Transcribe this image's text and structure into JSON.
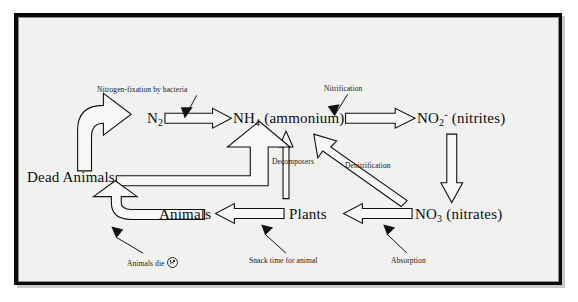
{
  "diagram": {
    "background_color": "#f1f1ef",
    "frame_color": "#0a0a0a",
    "ink_color": "#0d0d0d",
    "nodes": [
      {
        "id": "n2",
        "text": "N2",
        "display": "N₂",
        "x": 128,
        "y": 100
      },
      {
        "id": "nh4",
        "text": "NH4 (ammonium)",
        "display": "NH₄ (ammonium)",
        "x": 228,
        "y": 100
      },
      {
        "id": "no2",
        "text": "NO2- (nitrites)",
        "display": "NO₂⁻ (nitrites)",
        "x": 410,
        "y": 100
      },
      {
        "id": "no3",
        "text": "NO3 (nitrates)",
        "display": "NO₃ (nitrates)",
        "x": 408,
        "y": 196
      },
      {
        "id": "plants",
        "text": "Plants",
        "display": "Plants",
        "x": 294,
        "y": 196
      },
      {
        "id": "animals",
        "text": "Animals",
        "display": "Animals",
        "x": 160,
        "y": 196
      },
      {
        "id": "dead_animals",
        "text": "Dead Animals",
        "display": "Dead Animals",
        "x": 10,
        "y": 160
      }
    ],
    "process_labels": [
      {
        "id": "nitrogen_fixation",
        "text": "Nitrogen-fixation by bacteria",
        "x": 96,
        "y": 66
      },
      {
        "id": "nitrification",
        "text": "Nitrification",
        "x": 324,
        "y": 64
      },
      {
        "id": "decomposers",
        "text": "Decomposers",
        "x": 239,
        "y": 143
      },
      {
        "id": "denitrification",
        "text": "Denitrification",
        "x": 334,
        "y": 145
      },
      {
        "id": "animals_die",
        "text": "Animals die",
        "x": 104,
        "y": 226,
        "icon": "sad-face-icon"
      },
      {
        "id": "snack_time",
        "text": "Snack time for animal",
        "x": 210,
        "y": 226
      },
      {
        "id": "absorption",
        "text": "Absorption",
        "x": 345,
        "y": 226
      }
    ],
    "flows": [
      {
        "id": "flow-n2-to-nh4",
        "from": "N2",
        "to": "NH4 (ammonium)",
        "label": "Nitrogen-fixation by bacteria",
        "style": "block-arrow"
      },
      {
        "id": "flow-nh4-to-no2",
        "from": "NH4 (ammonium)",
        "to": "NO2- (nitrites)",
        "label": "Nitrification",
        "style": "block-arrow"
      },
      {
        "id": "flow-no2-to-no3",
        "from": "NO2- (nitrites)",
        "to": "NO3 (nitrates)",
        "label": "",
        "style": "block-arrow-down"
      },
      {
        "id": "flow-no3-to-plants",
        "from": "NO3 (nitrates)",
        "to": "Plants",
        "label": "Absorption",
        "style": "block-arrow-left"
      },
      {
        "id": "flow-no3-to-nh4",
        "from": "NO3 (nitrates)",
        "to": "NH4 (ammonium)",
        "label": "Denitrification",
        "style": "diagonal-arrow"
      },
      {
        "id": "flow-plants-to-nh4",
        "from": "Plants",
        "to": "NH4 (ammonium)",
        "label": "",
        "style": "thin-arrow-up"
      },
      {
        "id": "flow-plants-to-animals",
        "from": "Plants",
        "to": "Animals",
        "label": "Snack time for animal",
        "style": "block-arrow-left"
      },
      {
        "id": "flow-animals-to-dead",
        "from": "Animals",
        "to": "Dead Animals",
        "label": "Animals die",
        "style": "curved-arrow"
      },
      {
        "id": "flow-dead-to-nh4",
        "from": "Dead Animals",
        "to": "NH4 (ammonium)",
        "label": "Decomposers",
        "style": "elbow-block-arrow"
      },
      {
        "id": "flow-dead-to-n2",
        "from": "Dead Animals",
        "to": "N2",
        "label": "",
        "style": "curved-block-arrow"
      }
    ]
  }
}
